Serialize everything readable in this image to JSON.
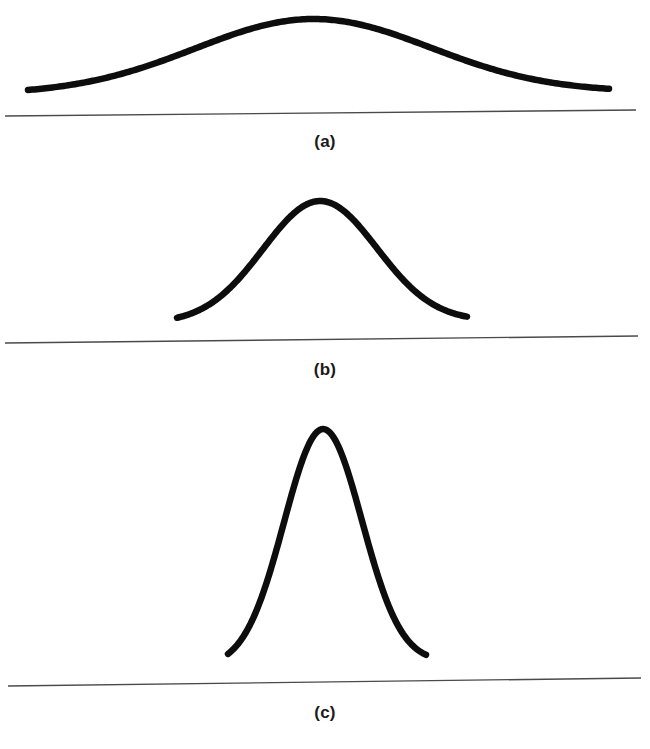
{
  "figure": {
    "background_color": "#ffffff",
    "curve_color": "#0d0d0d",
    "baseline_color": "#4a4a4a",
    "width": 650,
    "height": 749
  },
  "panels": [
    {
      "id": "a",
      "label": "(a)",
      "label_x": 313,
      "label_y": 132,
      "panel_top": 0,
      "panel_height": 165,
      "curve": {
        "peak_x": 313,
        "peak_y": 20,
        "left_x": 28,
        "left_y": 95,
        "right_x": 609,
        "right_y": 93,
        "sigma_px": 118,
        "stroke_width": 6.5
      },
      "baseline": {
        "x1": 5,
        "y1": 116,
        "x2": 636,
        "y2": 110
      }
    },
    {
      "id": "b",
      "label": "(b)",
      "label_x": 318,
      "label_y": 360,
      "panel_top": 165,
      "panel_height": 230,
      "curve": {
        "peak_x": 320,
        "peak_y": 202,
        "left_x": 177,
        "left_y": 324,
        "right_x": 467,
        "right_y": 322,
        "sigma_px": 57,
        "stroke_width": 6.5
      },
      "baseline": {
        "x1": 5,
        "y1": 343,
        "x2": 638,
        "y2": 336
      }
    },
    {
      "id": "c",
      "label": "(c)",
      "label_x": 320,
      "label_y": 703,
      "panel_top": 395,
      "panel_height": 354,
      "curve": {
        "peak_x": 323,
        "peak_y": 431,
        "left_x": 228,
        "left_y": 668,
        "right_x": 426,
        "right_y": 664,
        "sigma_px": 39,
        "stroke_width": 6.5
      },
      "baseline": {
        "x1": 8,
        "y1": 686,
        "x2": 641,
        "y2": 678
      }
    }
  ],
  "chart_data": {
    "type": "line",
    "subtitle": "",
    "xlabel": "",
    "ylabel": "",
    "grid": false,
    "legend_position": "none",
    "annotations": [
      "(a)",
      "(b)",
      "(c)"
    ],
    "series": [
      {
        "name": "(a)",
        "description": "Wide, low normal curve — large standard deviation",
        "mean": 0,
        "sigma": 1.0,
        "peak_height": 1.0,
        "x_extent": [
          -2.4,
          2.5
        ],
        "x": [
          -2.4,
          -2.0,
          -1.6,
          -1.2,
          -0.8,
          -0.4,
          0.0,
          0.4,
          0.8,
          1.2,
          1.6,
          2.0,
          2.5
        ],
        "y": [
          0.056,
          0.135,
          0.278,
          0.487,
          0.726,
          0.923,
          1.0,
          0.923,
          0.726,
          0.487,
          0.278,
          0.135,
          0.044
        ]
      },
      {
        "name": "(b)",
        "description": "Medium-width normal curve — moderate standard deviation",
        "mean": 0,
        "sigma": 0.48,
        "peak_height": 1.0,
        "x_extent": [
          -1.21,
          1.24
        ],
        "x": [
          -1.21,
          -1.0,
          -0.8,
          -0.6,
          -0.4,
          -0.2,
          0.0,
          0.2,
          0.4,
          0.6,
          0.8,
          1.0,
          1.24
        ],
        "y": [
          0.018,
          0.067,
          0.177,
          0.366,
          0.595,
          0.84,
          1.0,
          0.84,
          0.595,
          0.366,
          0.177,
          0.067,
          0.015
        ]
      },
      {
        "name": "(c)",
        "description": "Narrow, tall normal curve — small standard deviation",
        "mean": 0,
        "sigma": 0.33,
        "peak_height": 1.0,
        "x_extent": [
          -0.81,
          0.87
        ],
        "x": [
          -0.81,
          -0.7,
          -0.55,
          -0.4,
          -0.3,
          -0.15,
          0.0,
          0.15,
          0.3,
          0.4,
          0.55,
          0.7,
          0.87
        ],
        "y": [
          0.025,
          0.063,
          0.177,
          0.395,
          0.628,
          0.9,
          1.0,
          0.9,
          0.628,
          0.395,
          0.177,
          0.063,
          0.015
        ]
      }
    ]
  }
}
